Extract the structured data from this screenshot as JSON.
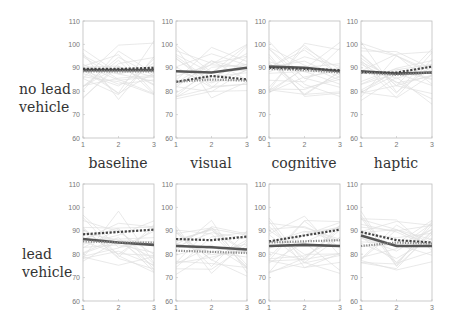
{
  "row_labels": [
    {
      "line1": "no lead",
      "line2": "vehicle"
    },
    {
      "line1": "lead",
      "line2": "vehicle"
    }
  ],
  "column_labels": [
    "baseline",
    "visual",
    "cognitive",
    "haptic"
  ],
  "axis": {
    "y_ticks": [
      "110",
      "100",
      "90",
      "80",
      "70",
      "60"
    ],
    "x_ticks": [
      "1",
      "2",
      "3"
    ]
  },
  "colors": {
    "axis": "#bdbdbd",
    "tick_text": "#777777",
    "individual_lines": "#e0e0e0",
    "solid_mean": "#555555",
    "dashed_mean": "#444444",
    "dotted_mean": "#8a8a8a"
  },
  "chart_data": [
    {
      "type": "line",
      "row": "no lead vehicle",
      "column": "baseline",
      "x": [
        1,
        2,
        3
      ],
      "ylim": [
        60,
        110
      ],
      "series": [
        {
          "name": "mean A (solid)",
          "values": [
            89,
            89,
            89
          ]
        },
        {
          "name": "mean B (dashed)",
          "values": [
            89.5,
            89.5,
            90
          ]
        },
        {
          "name": "mean C (dotted)",
          "values": [
            88.5,
            88.5,
            88.5
          ]
        }
      ]
    },
    {
      "type": "line",
      "row": "no lead vehicle",
      "column": "visual",
      "x": [
        1,
        2,
        3
      ],
      "ylim": [
        60,
        110
      ],
      "series": [
        {
          "name": "mean A (solid)",
          "values": [
            88.5,
            88,
            90
          ]
        },
        {
          "name": "mean B (dashed)",
          "values": [
            84,
            86.5,
            85
          ]
        },
        {
          "name": "mean C (dotted)",
          "values": [
            84,
            85,
            84.5
          ]
        }
      ]
    },
    {
      "type": "line",
      "row": "no lead vehicle",
      "column": "cognitive",
      "x": [
        1,
        2,
        3
      ],
      "ylim": [
        60,
        110
      ],
      "series": [
        {
          "name": "mean A (solid)",
          "values": [
            90.5,
            90,
            88.5
          ]
        },
        {
          "name": "mean B (dashed)",
          "values": [
            90,
            89.5,
            89
          ]
        },
        {
          "name": "mean C (dotted)",
          "values": [
            89.5,
            89,
            88
          ]
        }
      ]
    },
    {
      "type": "line",
      "row": "no lead vehicle",
      "column": "haptic",
      "x": [
        1,
        2,
        3
      ],
      "ylim": [
        60,
        110
      ],
      "series": [
        {
          "name": "mean A (solid)",
          "values": [
            88.5,
            87.5,
            88
          ]
        },
        {
          "name": "mean B (dashed)",
          "values": [
            88,
            88,
            90.5
          ]
        },
        {
          "name": "mean C (dotted)",
          "values": [
            88,
            87,
            88
          ]
        }
      ]
    },
    {
      "type": "line",
      "row": "lead vehicle",
      "column": "baseline",
      "x": [
        1,
        2,
        3
      ],
      "ylim": [
        60,
        110
      ],
      "series": [
        {
          "name": "mean A (solid)",
          "values": [
            86.5,
            85,
            84
          ]
        },
        {
          "name": "mean B (dashed)",
          "values": [
            88.5,
            89.5,
            90.5
          ]
        },
        {
          "name": "mean C (dotted)",
          "values": [
            85.5,
            85,
            85
          ]
        }
      ]
    },
    {
      "type": "line",
      "row": "lead vehicle",
      "column": "visual",
      "x": [
        1,
        2,
        3
      ],
      "ylim": [
        60,
        110
      ],
      "series": [
        {
          "name": "mean A (solid)",
          "values": [
            83.5,
            83,
            82
          ]
        },
        {
          "name": "mean B (dashed)",
          "values": [
            86.5,
            86,
            87.5
          ]
        },
        {
          "name": "mean C (dotted)",
          "values": [
            81.5,
            81,
            80.5
          ]
        }
      ]
    },
    {
      "type": "line",
      "row": "lead vehicle",
      "column": "cognitive",
      "x": [
        1,
        2,
        3
      ],
      "ylim": [
        60,
        110
      ],
      "series": [
        {
          "name": "mean A (solid)",
          "values": [
            83.5,
            84,
            83.5
          ]
        },
        {
          "name": "mean B (dashed)",
          "values": [
            85.5,
            88,
            90.5
          ]
        },
        {
          "name": "mean C (dotted)",
          "values": [
            85,
            85.5,
            86
          ]
        }
      ]
    },
    {
      "type": "line",
      "row": "lead vehicle",
      "column": "haptic",
      "x": [
        1,
        2,
        3
      ],
      "ylim": [
        60,
        110
      ],
      "series": [
        {
          "name": "mean A (solid)",
          "values": [
            88,
            83.5,
            83.5
          ]
        },
        {
          "name": "mean B (dashed)",
          "values": [
            89.5,
            86,
            85
          ]
        },
        {
          "name": "mean C (dotted)",
          "values": [
            83.5,
            85,
            84.5
          ]
        }
      ]
    }
  ]
}
